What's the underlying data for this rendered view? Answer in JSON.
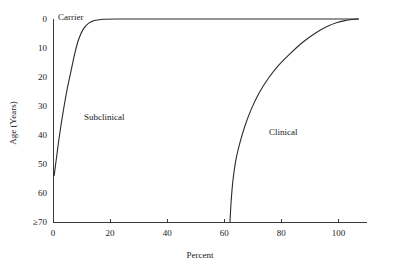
{
  "chart_data": {
    "type": "line",
    "title": "",
    "xlabel": "Percent",
    "ylabel": "Age (Years)",
    "xlim": [
      0,
      110
    ],
    "ylim": [
      0,
      70
    ],
    "y_inverted": true,
    "grid": false,
    "legend": "none",
    "xticks": [
      0,
      20,
      40,
      60,
      80,
      100
    ],
    "xticklabels": [
      "0",
      "20",
      "40",
      "60",
      "80",
      "100"
    ],
    "yticks": [
      0,
      10,
      20,
      30,
      40,
      50,
      60,
      70
    ],
    "yticklabels": [
      "0",
      "10",
      "20",
      "30",
      "40",
      "50",
      "60",
      "≥70"
    ],
    "annotations": [
      {
        "text": "Carrier",
        "x": 3,
        "y": 0
      },
      {
        "text": "Subclinical",
        "x": 14,
        "y": 33
      },
      {
        "text": "Clinical",
        "x": 76,
        "y": 39
      }
    ],
    "series": [
      {
        "name": "Subclinical",
        "points": [
          [
            0.4,
            54.0
          ],
          [
            1.2,
            48.0
          ],
          [
            2.0,
            42.0
          ],
          [
            2.9,
            36.0
          ],
          [
            3.9,
            30.0
          ],
          [
            5.0,
            24.0
          ],
          [
            6.3,
            18.0
          ],
          [
            7.6,
            12.0
          ],
          [
            9.0,
            7.0
          ],
          [
            10.6,
            3.5
          ],
          [
            12.5,
            1.4
          ],
          [
            14.5,
            0.5
          ],
          [
            17.0,
            0.15
          ],
          [
            22.0,
            0.0
          ],
          [
            40.0,
            0.0
          ],
          [
            60.0,
            0.0
          ],
          [
            80.0,
            0.0
          ],
          [
            100.0,
            0.0
          ],
          [
            107.0,
            0.0
          ]
        ]
      },
      {
        "name": "Clinical",
        "points": [
          [
            62.0,
            70.0
          ],
          [
            62.4,
            63.0
          ],
          [
            63.0,
            56.0
          ],
          [
            64.0,
            49.0
          ],
          [
            65.4,
            43.0
          ],
          [
            67.2,
            37.0
          ],
          [
            69.5,
            31.0
          ],
          [
            72.2,
            25.5
          ],
          [
            75.4,
            20.5
          ],
          [
            79.0,
            16.0
          ],
          [
            83.0,
            12.0
          ],
          [
            87.5,
            8.0
          ],
          [
            92.0,
            4.8
          ],
          [
            96.0,
            2.6
          ],
          [
            99.5,
            1.2
          ],
          [
            102.5,
            0.5
          ],
          [
            105.0,
            0.15
          ],
          [
            107.0,
            0.0
          ]
        ]
      }
    ]
  },
  "geometry": {
    "plot_left": 53,
    "plot_right": 367,
    "plot_top": 19,
    "plot_bottom": 222
  }
}
